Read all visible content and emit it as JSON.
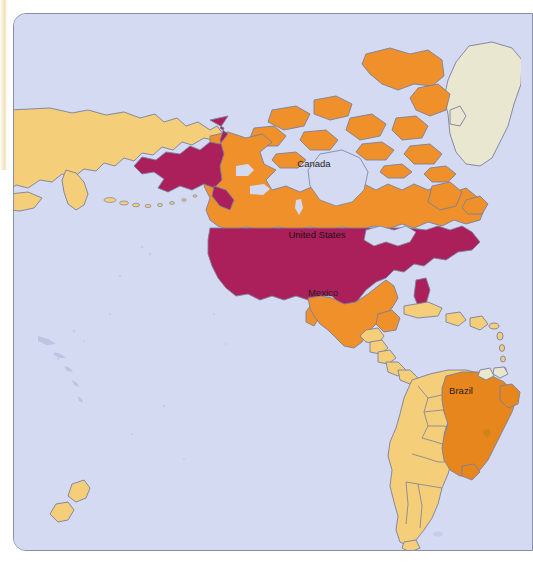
{
  "map": {
    "title": "World map of the Americas",
    "projection_note": "Pacific-centred world map, Americas region",
    "frame": {
      "border_color": "#8a90a8",
      "corner_radius": 13
    },
    "colors": {
      "ocean": "#d3daf2",
      "highlight_crimson": "#ab1f5a",
      "highlight_orange": "#f0902a",
      "highlight_dark_orange": "#e8861e",
      "light_yellow": "#f5ce7a",
      "neutral_cream": "#eae7d0",
      "border_line": "#7b7f9c",
      "label_text": "#231f20",
      "page_edge": "#f1dfb2"
    },
    "labels": [
      {
        "name": "Canada",
        "text": "Canada",
        "x": 313,
        "y": 166,
        "fill": "#f0902a"
      },
      {
        "name": "United States",
        "text": "United States",
        "x": 316,
        "y": 237,
        "fill": "#ab1f5a"
      },
      {
        "name": "Mexico",
        "text": "Mexico",
        "x": 322,
        "y": 295,
        "fill": "#f0902a"
      },
      {
        "name": "Brazil",
        "text": "Brazil",
        "x": 460,
        "y": 393,
        "fill": "#e8861e"
      }
    ],
    "legend_categories": [
      {
        "key": "crimson",
        "color": "#ab1f5a",
        "countries": [
          "United States"
        ]
      },
      {
        "key": "orange",
        "color": "#f0902a",
        "countries": [
          "Canada",
          "Mexico"
        ]
      },
      {
        "key": "dark-orange",
        "color": "#e8861e",
        "countries": [
          "Brazil"
        ]
      },
      {
        "key": "light-yellow",
        "color": "#f5ce7a",
        "countries": [
          "Russia",
          "Central America",
          "Caribbean",
          "Colombia",
          "Venezuela",
          "Peru",
          "Bolivia",
          "Chile",
          "Argentina",
          "Paraguay",
          "Uruguay",
          "Ecuador",
          "Guyana",
          "New Zealand"
        ]
      },
      {
        "key": "cream",
        "color": "#eae7d0",
        "countries": [
          "Greenland"
        ]
      }
    ],
    "unlabelled_regions": [
      "Greenland",
      "Russia (far east)",
      "Aleutian Islands",
      "Canadian Arctic Archipelago",
      "Caribbean islands",
      "South America (non-Brazil)",
      "New Zealand"
    ]
  }
}
